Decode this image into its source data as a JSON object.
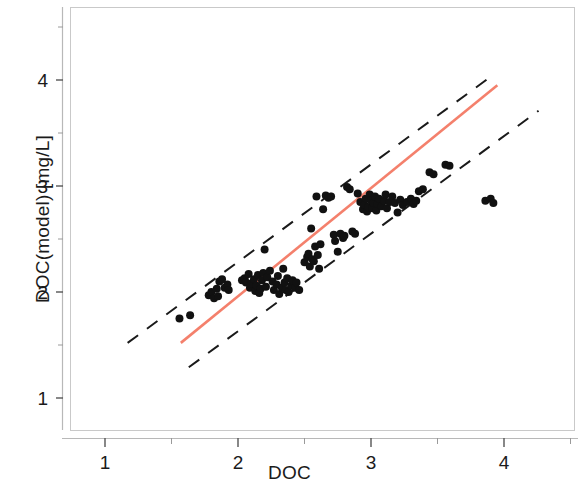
{
  "chart_data": {
    "type": "scatter",
    "title": "",
    "xlabel": "DOC",
    "ylabel": "DOC(model) [mg/L]",
    "xlim": [
      0.77,
      4.53
    ],
    "ylim": [
      0.72,
      4.6
    ],
    "xticks": [
      1,
      2,
      3,
      4
    ],
    "yticks": [
      1,
      2,
      3,
      4
    ],
    "xtick_labels": [
      "1",
      "2",
      "3",
      "4"
    ],
    "ytick_labels": [
      "1",
      "2",
      "3",
      "4"
    ],
    "xminor_ticks": [
      1.5,
      2.5,
      3.5,
      4.5
    ],
    "yminor_ticks": [
      1.5,
      2.5,
      3.5,
      4.5
    ],
    "grid": false,
    "legend": "none",
    "marker": {
      "shape": "circle",
      "color": "#111111",
      "size": 7
    },
    "series": [
      {
        "name": "observations",
        "points": [
          [
            1.56,
            1.75
          ],
          [
            1.64,
            1.78
          ],
          [
            1.78,
            1.97
          ],
          [
            1.8,
            2.0
          ],
          [
            1.82,
            1.94
          ],
          [
            1.84,
            2.03
          ],
          [
            1.86,
            2.1
          ],
          [
            1.88,
            2.12
          ],
          [
            1.9,
            2.04
          ],
          [
            1.92,
            2.07
          ],
          [
            1.93,
            2.02
          ],
          [
            1.85,
            1.96
          ],
          [
            2.03,
            2.11
          ],
          [
            2.05,
            2.13
          ],
          [
            2.06,
            2.09
          ],
          [
            2.08,
            2.17
          ],
          [
            2.09,
            2.04
          ],
          [
            2.1,
            2.08
          ],
          [
            2.12,
            2.12
          ],
          [
            2.13,
            2.01
          ],
          [
            2.14,
            2.06
          ],
          [
            2.15,
            2.16
          ],
          [
            2.16,
            1.99
          ],
          [
            2.17,
            2.03
          ],
          [
            2.18,
            2.11
          ],
          [
            2.19,
            2.18
          ],
          [
            2.2,
            2.4
          ],
          [
            2.21,
            2.05
          ],
          [
            2.22,
            2.14
          ],
          [
            2.24,
            2.2
          ],
          [
            2.26,
            2.1
          ],
          [
            2.27,
            2.02
          ],
          [
            2.29,
            2.07
          ],
          [
            2.3,
            2.15
          ],
          [
            2.31,
            1.98
          ],
          [
            2.33,
            2.04
          ],
          [
            2.34,
            2.22
          ],
          [
            2.35,
            2.09
          ],
          [
            2.36,
            2.02
          ],
          [
            2.37,
            2.13
          ],
          [
            2.38,
            2.0
          ],
          [
            2.4,
            2.06
          ],
          [
            2.41,
            2.11
          ],
          [
            2.43,
            2.04
          ],
          [
            2.44,
            2.09
          ],
          [
            2.46,
            2.02
          ],
          [
            2.5,
            2.28
          ],
          [
            2.52,
            2.33
          ],
          [
            2.53,
            2.36
          ],
          [
            2.54,
            2.24
          ],
          [
            2.55,
            2.6
          ],
          [
            2.56,
            2.31
          ],
          [
            2.57,
            2.29
          ],
          [
            2.58,
            2.43
          ],
          [
            2.59,
            2.9
          ],
          [
            2.6,
            2.35
          ],
          [
            2.61,
            2.22
          ],
          [
            2.62,
            2.45
          ],
          [
            2.64,
            2.78
          ],
          [
            2.66,
            2.91
          ],
          [
            2.68,
            2.89
          ],
          [
            2.7,
            2.9
          ],
          [
            2.72,
            2.54
          ],
          [
            2.73,
            2.48
          ],
          [
            2.75,
            2.38
          ],
          [
            2.77,
            2.55
          ],
          [
            2.79,
            2.51
          ],
          [
            2.8,
            2.53
          ],
          [
            2.82,
            2.99
          ],
          [
            2.84,
            2.97
          ],
          [
            2.86,
            2.57
          ],
          [
            2.88,
            2.55
          ],
          [
            2.9,
            2.93
          ],
          [
            2.92,
            2.85
          ],
          [
            2.94,
            2.78
          ],
          [
            2.95,
            2.82
          ],
          [
            2.96,
            2.88
          ],
          [
            2.97,
            2.76
          ],
          [
            2.98,
            2.8
          ],
          [
            2.99,
            2.92
          ],
          [
            3.0,
            2.86
          ],
          [
            3.01,
            2.79
          ],
          [
            3.02,
            2.84
          ],
          [
            3.03,
            2.9
          ],
          [
            3.04,
            2.77
          ],
          [
            3.05,
            2.83
          ],
          [
            3.06,
            2.88
          ],
          [
            3.08,
            2.81
          ],
          [
            3.1,
            2.86
          ],
          [
            3.11,
            2.92
          ],
          [
            3.12,
            2.79
          ],
          [
            3.14,
            2.85
          ],
          [
            3.16,
            2.9
          ],
          [
            3.18,
            2.84
          ],
          [
            3.2,
            2.75
          ],
          [
            3.22,
            2.87
          ],
          [
            3.24,
            2.82
          ],
          [
            3.27,
            2.85
          ],
          [
            3.3,
            2.88
          ],
          [
            3.32,
            2.83
          ],
          [
            3.34,
            2.86
          ],
          [
            3.36,
            2.95
          ],
          [
            3.39,
            2.97
          ],
          [
            3.44,
            3.13
          ],
          [
            3.47,
            3.11
          ],
          [
            3.56,
            3.2
          ],
          [
            3.59,
            3.19
          ],
          [
            3.86,
            2.86
          ],
          [
            3.9,
            2.88
          ],
          [
            3.92,
            2.84
          ]
        ]
      }
    ],
    "lines": [
      {
        "name": "1:1 regression line",
        "style": "solid",
        "color": "#f4806c",
        "width": 2.6,
        "x": [
          1.57,
          3.95
        ],
        "y": [
          1.52,
          3.95
        ]
      },
      {
        "name": "upper confidence bound",
        "style": "dashed",
        "color": "#1a1a1a",
        "width": 2.0,
        "x": [
          1.17,
          3.92
        ],
        "y": [
          1.52,
          4.05
        ]
      },
      {
        "name": "lower confidence bound",
        "style": "dashed",
        "color": "#1a1a1a",
        "width": 2.0,
        "x": [
          1.63,
          4.26
        ],
        "y": [
          1.29,
          3.71
        ]
      }
    ]
  },
  "axes": {
    "x_title": "DOC",
    "y_title": "DOC(model) [mg/L]"
  }
}
